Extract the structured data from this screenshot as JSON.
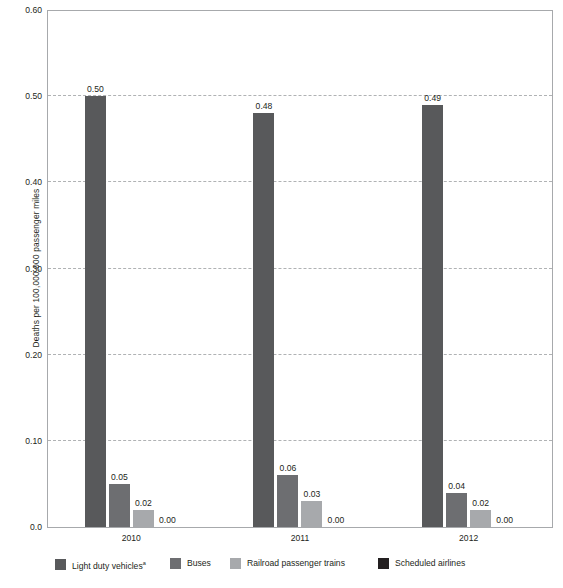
{
  "chart_data": {
    "type": "bar",
    "title": "",
    "subtitle": "",
    "xlabel": "",
    "ylabel": "Deaths per 100,000,000 passenger miles",
    "categories": [
      "2010",
      "2011",
      "2012"
    ],
    "series": [
      {
        "name": "Light duty vehicles",
        "footnote_marker": "a",
        "color": "#58595b",
        "values": [
          0.5,
          0.48,
          0.49
        ],
        "labels": [
          "0.50",
          "0.48",
          "0.49"
        ]
      },
      {
        "name": "Buses",
        "footnote_marker": "",
        "color": "#6d6e71",
        "values": [
          0.05,
          0.06,
          0.04
        ],
        "labels": [
          "0.05",
          "0.06",
          "0.04"
        ]
      },
      {
        "name": "Railroad passenger trains",
        "footnote_marker": "",
        "color": "#a7a9ac",
        "values": [
          0.02,
          0.03,
          0.02
        ],
        "labels": [
          "0.02",
          "0.03",
          "0.02"
        ]
      },
      {
        "name": "Scheduled airlines",
        "footnote_marker": "",
        "color": "#231f20",
        "values": [
          0.0,
          0.0,
          0.0
        ],
        "labels": [
          "0.00",
          "0.00",
          "0.00"
        ]
      }
    ],
    "ylim": [
      0.0,
      0.6
    ],
    "yticks": [
      0.0,
      0.1,
      0.2,
      0.3,
      0.4,
      0.5,
      0.6
    ],
    "ytick_labels": [
      "0.0",
      "0.10",
      "0.20",
      "0.30",
      "0.40",
      "0.50",
      "0.60"
    ],
    "grid": true,
    "grid_style": "dashed-horizontal",
    "legend_position": "bottom"
  },
  "axes": {
    "y_title": "Deaths per 100,000,000 passenger miles"
  },
  "legend": {
    "items": [
      {
        "label": "Light duty vehicles",
        "marker": "a",
        "color": "#58595b"
      },
      {
        "label": "Buses",
        "marker": "",
        "color": "#6d6e71"
      },
      {
        "label": "Railroad passenger trains",
        "marker": "",
        "color": "#a7a9ac"
      },
      {
        "label": "Scheduled airlines",
        "marker": "",
        "color": "#231f20"
      }
    ]
  },
  "colors": {
    "frame": "#a7a9ac",
    "gridline": "#b0b2b4",
    "text": "#231f20",
    "background": "#ffffff"
  }
}
